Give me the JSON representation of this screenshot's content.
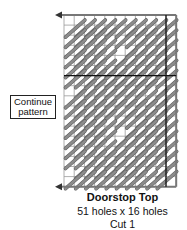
{
  "diagram": {
    "title": "Doorstop Top",
    "dimensions": "51 holes x 16 holes",
    "cut": "Cut 1",
    "note": "Continue pattern",
    "grid": {
      "left": 64,
      "top": 15,
      "cols": 11,
      "rows": 17,
      "cell_w": 10.2,
      "cell_h": 10.1,
      "dark_col_line": 10,
      "dark_row_line": 6
    },
    "colors": {
      "grid_line": "#9a9a9a",
      "dark_line": "#111111",
      "stitch": "#8c8c8c",
      "stitch_edge": "#5a5a5a",
      "border": "#777777",
      "arrow": "#333333"
    },
    "icons": {
      "top_arrow": "arrow-left-icon",
      "bottom_arrow": "arrow-left-icon"
    }
  }
}
